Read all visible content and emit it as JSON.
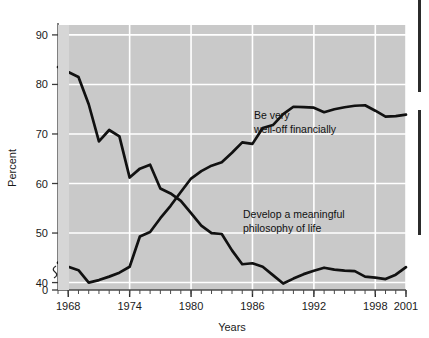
{
  "chart_data": {
    "type": "line",
    "title": "",
    "xlabel": "Years",
    "ylabel": "Percent",
    "xlim": [
      1967,
      2001
    ],
    "ylim": [
      38.5,
      92
    ],
    "y_axis_break": true,
    "y_break_label": "0",
    "grid": true,
    "grid_color": "#ffffff",
    "plot_bg_color": "#c9c9c9",
    "line_color": "#111111",
    "legend_position": "inline-annotations",
    "ytick_labels": [
      "0",
      "40",
      "50",
      "60",
      "70",
      "80",
      "90"
    ],
    "yticks": [
      0,
      40,
      50,
      60,
      70,
      80,
      90
    ],
    "xtick_labels": [
      "1968",
      "1974",
      "1980",
      "1986",
      "1992",
      "1998",
      "2001"
    ],
    "xticks": [
      1968,
      1974,
      1980,
      1986,
      1992,
      1998,
      2001
    ],
    "xtick_minor_step": 1,
    "series": [
      {
        "name": "Develop a meaningful philosophy of life",
        "annotation_lines": [
          "Develop a meaningful",
          "philosophy of life"
        ],
        "x": [
          1967,
          1968,
          1969,
          1970,
          1971,
          1972,
          1973,
          1974,
          1975,
          1976,
          1977,
          1978,
          1979,
          1980,
          1981,
          1982,
          1983,
          1984,
          1985,
          1986,
          1987,
          1988,
          1989,
          1990,
          1991,
          1992,
          1993,
          1994,
          1995,
          1996,
          1997,
          1998,
          1999,
          2000,
          2001
        ],
        "values": [
          83.5,
          82.5,
          81.5,
          76.0,
          68.5,
          70.8,
          69.5,
          61.2,
          63.0,
          63.8,
          59.0,
          58.0,
          56.5,
          54.0,
          51.5,
          50.0,
          49.8,
          46.5,
          43.7,
          43.9,
          43.2,
          41.5,
          39.8,
          40.8,
          41.7,
          42.4,
          43.0,
          42.6,
          42.4,
          42.3,
          41.2,
          41.0,
          40.7,
          41.6,
          43.1
        ]
      },
      {
        "name": "Be very well-off financially",
        "annotation_lines": [
          "Be very",
          "well-off financially"
        ],
        "x": [
          1967,
          1968,
          1969,
          1970,
          1971,
          1972,
          1973,
          1974,
          1975,
          1976,
          1977,
          1978,
          1979,
          1980,
          1981,
          1982,
          1983,
          1984,
          1985,
          1986,
          1987,
          1988,
          1989,
          1990,
          1991,
          1992,
          1993,
          1994,
          1995,
          1996,
          1997,
          1998,
          1999,
          2000,
          2001
        ],
        "values": [
          44.0,
          43.2,
          42.5,
          40.0,
          40.5,
          41.2,
          42.0,
          43.2,
          49.3,
          50.2,
          53.0,
          55.5,
          58.3,
          61.0,
          62.5,
          63.6,
          64.3,
          66.2,
          68.3,
          68.0,
          71.2,
          71.8,
          74.0,
          75.5,
          75.4,
          75.3,
          74.4,
          75.0,
          75.4,
          75.7,
          75.8,
          74.7,
          73.5,
          73.6,
          73.9
        ]
      }
    ]
  }
}
